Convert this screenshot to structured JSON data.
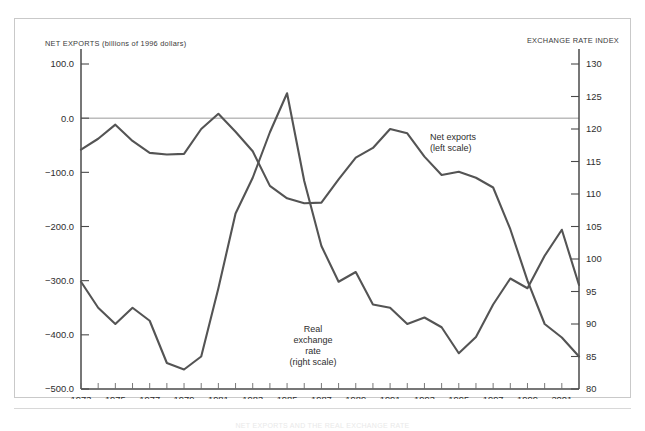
{
  "figure": {
    "left_axis_title": "NET EXPORTS (billions of 1996 dollars)",
    "right_axis_title": "EXCHANGE RATE INDEX",
    "footer_note": "NET EXPORTS AND THE REAL EXCHANGE RATE"
  },
  "annotations": {
    "net_exports": {
      "line1": "Net exports",
      "line2": "(left scale)"
    },
    "real_rate": {
      "line1": "Real",
      "line2": "exchange",
      "line3": "rate",
      "line4": "(right scale)"
    }
  },
  "chart_data": {
    "type": "line",
    "title": "",
    "xlabel": "",
    "grid": false,
    "legend": "inline-annotations",
    "x": [
      1973,
      1974,
      1975,
      1976,
      1977,
      1978,
      1979,
      1980,
      1981,
      1982,
      1983,
      1984,
      1985,
      1986,
      1987,
      1988,
      1989,
      1990,
      1991,
      1992,
      1993,
      1994,
      1995,
      1996,
      1997,
      1998,
      1999,
      2000,
      2001,
      2002
    ],
    "xlim": [
      1973,
      2002
    ],
    "xtick_labels": [
      "1973",
      "1975",
      "1977",
      "1979",
      "1981",
      "1983",
      "1985",
      "1987",
      "1989",
      "1991",
      "1993",
      "1995",
      "1997",
      "1999",
      "2001"
    ],
    "xtick_values": [
      1973,
      1975,
      1977,
      1979,
      1981,
      1983,
      1985,
      1987,
      1989,
      1991,
      1993,
      1995,
      1997,
      1999,
      2001
    ],
    "left_axis": {
      "label": "NET EXPORTS (billions of 1996 dollars)",
      "ylim": [
        -500,
        100
      ],
      "ticks": [
        100,
        0,
        -100,
        -200,
        -300,
        -400,
        -500
      ],
      "tick_labels": [
        "100.0",
        "0.0",
        "-100.0",
        "-200.0",
        "-300.0",
        "-400.0",
        "-500.0"
      ]
    },
    "right_axis": {
      "label": "EXCHANGE RATE INDEX",
      "ylim": [
        80,
        130
      ],
      "ticks": [
        130,
        125,
        120,
        115,
        110,
        105,
        100,
        95,
        90,
        85,
        80
      ],
      "tick_labels": [
        "130",
        "125",
        "120",
        "115",
        "110",
        "105",
        "100",
        "95",
        "90",
        "85",
        "80"
      ]
    },
    "series": [
      {
        "name": "Net exports",
        "axis": "left",
        "units": "billions of 1996 dollars",
        "color": "#545454",
        "values": [
          -58,
          -38,
          -12,
          -42,
          -64,
          -67,
          -66,
          -20,
          8,
          -25,
          -61,
          -125,
          -148,
          -157,
          -156,
          -113,
          -73,
          -55,
          -20,
          -28,
          -71,
          -105,
          -99,
          -110,
          -128,
          -205,
          -300,
          -380,
          -405,
          -440
        ]
      },
      {
        "name": "Real exchange rate",
        "axis": "right",
        "units": "index",
        "color": "#545454",
        "values": [
          96.5,
          92.5,
          90.0,
          92.5,
          90.5,
          84.0,
          83.0,
          85.0,
          95.5,
          107.0,
          112.5,
          119.5,
          125.5,
          112.0,
          102.0,
          96.5,
          98.0,
          93.0,
          92.5,
          90.0,
          91.0,
          89.5,
          85.5,
          88.0,
          93.0,
          97.0,
          95.5,
          100.5,
          104.5,
          96.0
        ]
      }
    ]
  }
}
